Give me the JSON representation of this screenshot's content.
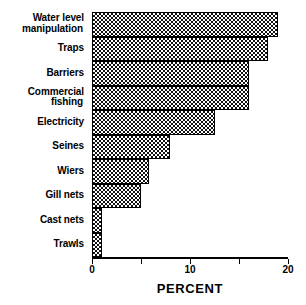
{
  "chart_data": {
    "type": "bar",
    "orientation": "horizontal",
    "title": "",
    "xlabel": "PERCENT",
    "ylabel": "",
    "xlim": [
      0,
      20
    ],
    "grid": false,
    "legend": null,
    "xticks": [
      0,
      5,
      10,
      15,
      20
    ],
    "xtick_labels": [
      "0",
      "",
      "10",
      "",
      "20"
    ],
    "categories": [
      "Water level manipulation",
      "Traps",
      "Barriers",
      "Commercial fishing",
      "Electricity",
      "Seines",
      "Wiers",
      "Gill nets",
      "Cast nets",
      "Trawls"
    ],
    "values": [
      19,
      18,
      16,
      16,
      12.5,
      8,
      5.8,
      5,
      1,
      1
    ],
    "bars": [
      {
        "label_line1": "Water level",
        "label_line2": "manipulation",
        "value": 19
      },
      {
        "label_line1": "Traps",
        "label_line2": "",
        "value": 18
      },
      {
        "label_line1": "Barriers",
        "label_line2": "",
        "value": 16
      },
      {
        "label_line1": "Commercial",
        "label_line2": "fishing",
        "value": 16
      },
      {
        "label_line1": "Electricity",
        "label_line2": "",
        "value": 12.5
      },
      {
        "label_line1": "Seines",
        "label_line2": "",
        "value": 8
      },
      {
        "label_line1": "Wiers",
        "label_line2": "",
        "value": 5.8
      },
      {
        "label_line1": "Gill nets",
        "label_line2": "",
        "value": 5
      },
      {
        "label_line1": "Cast nets",
        "label_line2": "",
        "value": 1
      },
      {
        "label_line1": "Trawls",
        "label_line2": "",
        "value": 1
      }
    ],
    "colors": {
      "bar_fill": "#ffffff",
      "bar_hatch": "#111111",
      "bar_edge": "#000000",
      "axis": "#000000",
      "text": "#000000",
      "background": "#ffffff"
    }
  }
}
